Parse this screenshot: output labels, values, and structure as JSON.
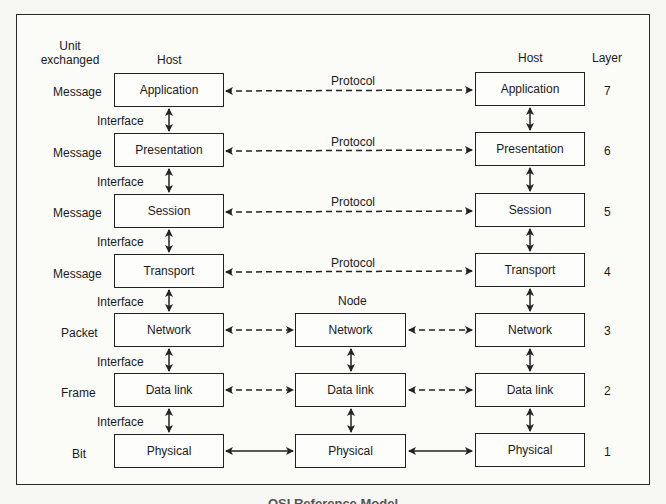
{
  "headers": {
    "unit_exchanged": [
      "Unit",
      "exchanged"
    ],
    "host_left": "Host",
    "host_right": "Host",
    "node": "Node",
    "layer": "Layer"
  },
  "interface_label": "Interface",
  "protocol_label": "Protocol",
  "layers": [
    {
      "number": "7",
      "name": "Application",
      "unit": "Message"
    },
    {
      "number": "6",
      "name": "Presentation",
      "unit": "Message"
    },
    {
      "number": "5",
      "name": "Session",
      "unit": "Message"
    },
    {
      "number": "4",
      "name": "Transport",
      "unit": "Message"
    },
    {
      "number": "3",
      "name": "Network",
      "unit": "Packet"
    },
    {
      "number": "2",
      "name": "Data link",
      "unit": "Frame"
    },
    {
      "number": "1",
      "name": "Physical",
      "unit": "Bit"
    }
  ],
  "node_layers": [
    "Network",
    "Data link",
    "Physical"
  ],
  "interfaces": [
    "Interface",
    "Interface",
    "Interface",
    "Interface",
    "Interface",
    "Interface"
  ],
  "caption": "OSI Reference Model"
}
